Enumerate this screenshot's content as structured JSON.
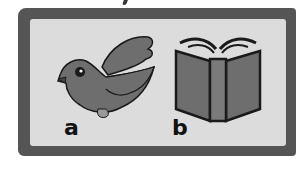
{
  "card": {
    "items": [
      {
        "label": "a",
        "picture": "bird-icon"
      },
      {
        "label": "b",
        "picture": "book-icon"
      }
    ]
  },
  "colors": {
    "frame": "#555555",
    "background": "#dcdcdc",
    "figure_fill": "#6e6e6e",
    "outline": "#1a1a1a"
  }
}
